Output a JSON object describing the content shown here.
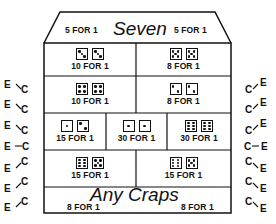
{
  "layout": {
    "seven": {
      "title": "Seven",
      "left_odds": "5 FOR 1",
      "right_odds": "5 FOR 1"
    },
    "rows": [
      [
        {
          "dice": [
            3,
            3
          ],
          "odds": "10 FOR 1"
        },
        {
          "dice": [
            5,
            5
          ],
          "odds": "8 FOR 1"
        }
      ],
      [
        {
          "dice": [
            4,
            4
          ],
          "odds": "10 FOR 1"
        },
        {
          "dice": [
            2,
            2
          ],
          "odds": "8 FOR 1"
        }
      ],
      [
        {
          "dice": [
            1,
            2
          ],
          "odds": "15 FOR 1"
        },
        {
          "dice": [
            1,
            1
          ],
          "odds": "30 FOR 1"
        },
        {
          "dice": [
            6,
            6
          ],
          "odds": "30 FOR 1"
        }
      ],
      [
        {
          "dice": [
            6,
            5
          ],
          "odds": "15 FOR 1"
        },
        {
          "dice": [
            6,
            5
          ],
          "odds": "15 FOR 1"
        }
      ]
    ],
    "any_craps": {
      "title": "Any Craps",
      "left_odds": "8 FOR 1",
      "right_odds": "8 FOR 1"
    }
  },
  "side_labels": {
    "e": "E",
    "c": "C"
  },
  "colors": {
    "line": "#111111",
    "background": "#ffffff"
  }
}
